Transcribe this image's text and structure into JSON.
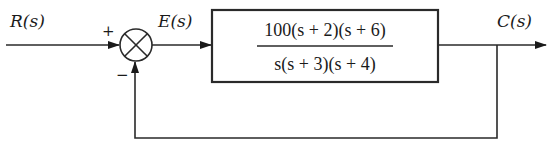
{
  "diagram": {
    "type": "closed-loop block diagram",
    "input": {
      "label": "R(s)"
    },
    "summing_junction": {
      "plus_sign": "+",
      "minus_sign": "−"
    },
    "error": {
      "label": "E(s)"
    },
    "plant": {
      "numerator": "100(s + 2)(s + 6)",
      "denominator": "s(s + 3)(s + 4)"
    },
    "output": {
      "label": "C(s)"
    },
    "feedback": {
      "type": "unity negative feedback"
    },
    "colors": {
      "line": "#2a2a2a",
      "background": "#ffffff"
    }
  }
}
